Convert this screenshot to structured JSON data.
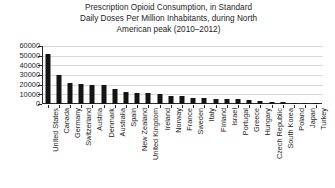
{
  "chart_data": {
    "type": "bar",
    "title": "Prescription Opioid Consumption, in Standard Daily Doses Per Million Inhabitants, during North American peak (2010–2012)",
    "title_lines": [
      "Prescription Opioid Consumption, in Standard",
      "Daily Doses Per Million Inhabitants, during North",
      "American peak (2010–2012)"
    ],
    "xlabel": "",
    "ylabel": "",
    "ylim": [
      0,
      60000
    ],
    "yticks": [
      0,
      10000,
      20000,
      30000,
      40000,
      50000,
      60000
    ],
    "ytick_labels": [
      "0",
      "10000",
      "20000",
      "30000",
      "40000",
      "50000",
      "60000"
    ],
    "grid": true,
    "legend": null,
    "bar_color": "#141414",
    "categories": [
      "United States",
      "Canada",
      "Germany",
      "Switzerland",
      "Austria",
      "Denmark",
      "Australia",
      "Spain",
      "New Zealand",
      "United Kingdom",
      "Ireland",
      "Norway",
      "France",
      "Sweden",
      "Italy",
      "Finland",
      "Israel",
      "Portugal",
      "Greece",
      "Hungary",
      "Czech Republic",
      "South Korea",
      "Poland",
      "Japan",
      "Turkey"
    ],
    "values": [
      52000,
      29800,
      21500,
      20200,
      20000,
      19500,
      15500,
      12200,
      11600,
      11000,
      10200,
      8500,
      8000,
      6600,
      6000,
      5600,
      5000,
      4700,
      4500,
      3100,
      2600,
      2000,
      1200,
      600,
      400
    ]
  }
}
